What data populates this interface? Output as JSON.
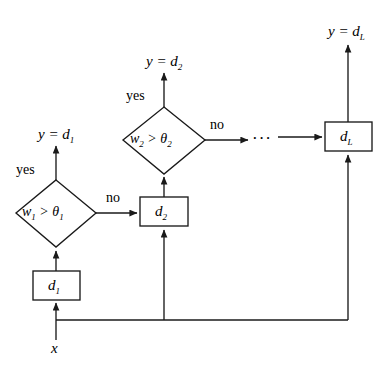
{
  "diagram": {
    "stroke_color": "#1a1a1a",
    "text_color": "#000000",
    "background_color": "#ffffff",
    "input": {
      "label": "x"
    },
    "stages": [
      {
        "id": "stage-1",
        "box_label": "d₁",
        "condition": "w₁ > θ₁",
        "yes_label": "yes",
        "no_label": "no",
        "output_label": "y = d₁"
      },
      {
        "id": "stage-2",
        "box_label": "d₂",
        "condition": "w₂ > θ₂",
        "yes_label": "yes",
        "no_label": "no",
        "output_label": "y = d₂"
      },
      {
        "id": "stage-L",
        "box_label": "dₗ",
        "condition": "",
        "yes_label": "",
        "no_label": "",
        "output_label": "y = dₗ"
      }
    ],
    "ellipsis": "···",
    "labels": {
      "input_x": "x",
      "y_eq_d1": "y = d",
      "y_eq_d1_sub": "1",
      "y_eq_d2": "y = d",
      "y_eq_d2_sub": "2",
      "y_eq_dL": "y = d",
      "y_eq_dL_sub": "L",
      "box_d1": "d",
      "box_d1_sub": "1",
      "box_d2": "d",
      "box_d2_sub": "2",
      "box_dL": "d",
      "box_dL_sub": "L",
      "cond1_w": "w",
      "cond1_wsub": "1",
      "cond1_op": " > ",
      "cond1_theta": "θ",
      "cond1_tsub": "1",
      "cond2_w": "w",
      "cond2_wsub": "2",
      "cond2_op": " > ",
      "cond2_theta": "θ",
      "cond2_tsub": "2",
      "yes1": "yes",
      "no1": "no",
      "yes2": "yes",
      "no2": "no",
      "dots": "···"
    }
  }
}
